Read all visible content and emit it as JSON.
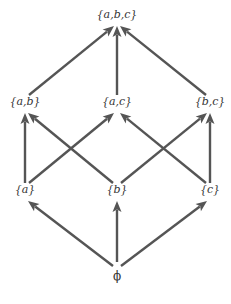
{
  "diagram": {
    "type": "lattice",
    "edge_color": "#555555",
    "text_color": "#333333",
    "nodes": [
      {
        "id": "abc",
        "label": "{a,b,c}",
        "level": 3,
        "column": 1
      },
      {
        "id": "ab",
        "label": "{a,b}",
        "level": 2,
        "column": 0
      },
      {
        "id": "ac",
        "label": "{a,c}",
        "level": 2,
        "column": 1
      },
      {
        "id": "bc",
        "label": "{b,c}",
        "level": 2,
        "column": 2
      },
      {
        "id": "a",
        "label": "{a}",
        "level": 1,
        "column": 0
      },
      {
        "id": "b",
        "label": "{b}",
        "level": 1,
        "column": 1
      },
      {
        "id": "c",
        "label": "{c}",
        "level": 1,
        "column": 2
      },
      {
        "id": "empty",
        "label": "ϕ",
        "level": 0,
        "column": 1
      }
    ],
    "edges": [
      {
        "from": "ab",
        "to": "abc"
      },
      {
        "from": "ac",
        "to": "abc"
      },
      {
        "from": "bc",
        "to": "abc"
      },
      {
        "from": "a",
        "to": "ab"
      },
      {
        "from": "a",
        "to": "ac"
      },
      {
        "from": "b",
        "to": "ab"
      },
      {
        "from": "b",
        "to": "bc"
      },
      {
        "from": "c",
        "to": "ac"
      },
      {
        "from": "c",
        "to": "bc"
      },
      {
        "from": "empty",
        "to": "a"
      },
      {
        "from": "empty",
        "to": "b"
      },
      {
        "from": "empty",
        "to": "c"
      }
    ]
  }
}
